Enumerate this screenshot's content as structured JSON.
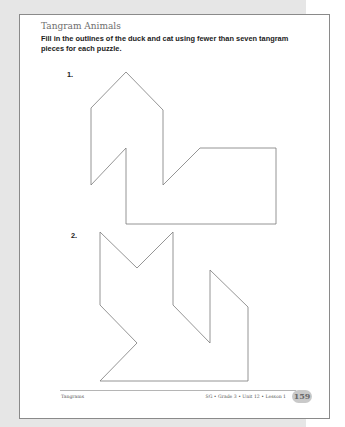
{
  "worksheet": {
    "title": "Tangram Animals",
    "instructions": "Fill in the outlines of the duck and cat using fewer than seven tangram pieces for each puzzle.",
    "problems": [
      {
        "number": "1.",
        "animal": "duck",
        "outline_points": "126,72 163,110 163,185 200,148 276,148 276,224 126,224 126,148 91,185 91,108"
      },
      {
        "number": "2.",
        "animal": "cat",
        "outline_points": "100,232 137,268 173,232 173,305 210,343 210,270 248,307 248,381 100,381 137,343 100,305"
      }
    ]
  },
  "footer": {
    "left": "Tangrams",
    "right": "SG • Grade 3 • Unit 12 • Lesson 1",
    "page_number": "159"
  },
  "colors": {
    "outline": "#7a7a7a",
    "backdrop": "#e6e6e6",
    "page_border": "#8a8a8a",
    "badge": "#c9c9c9"
  }
}
